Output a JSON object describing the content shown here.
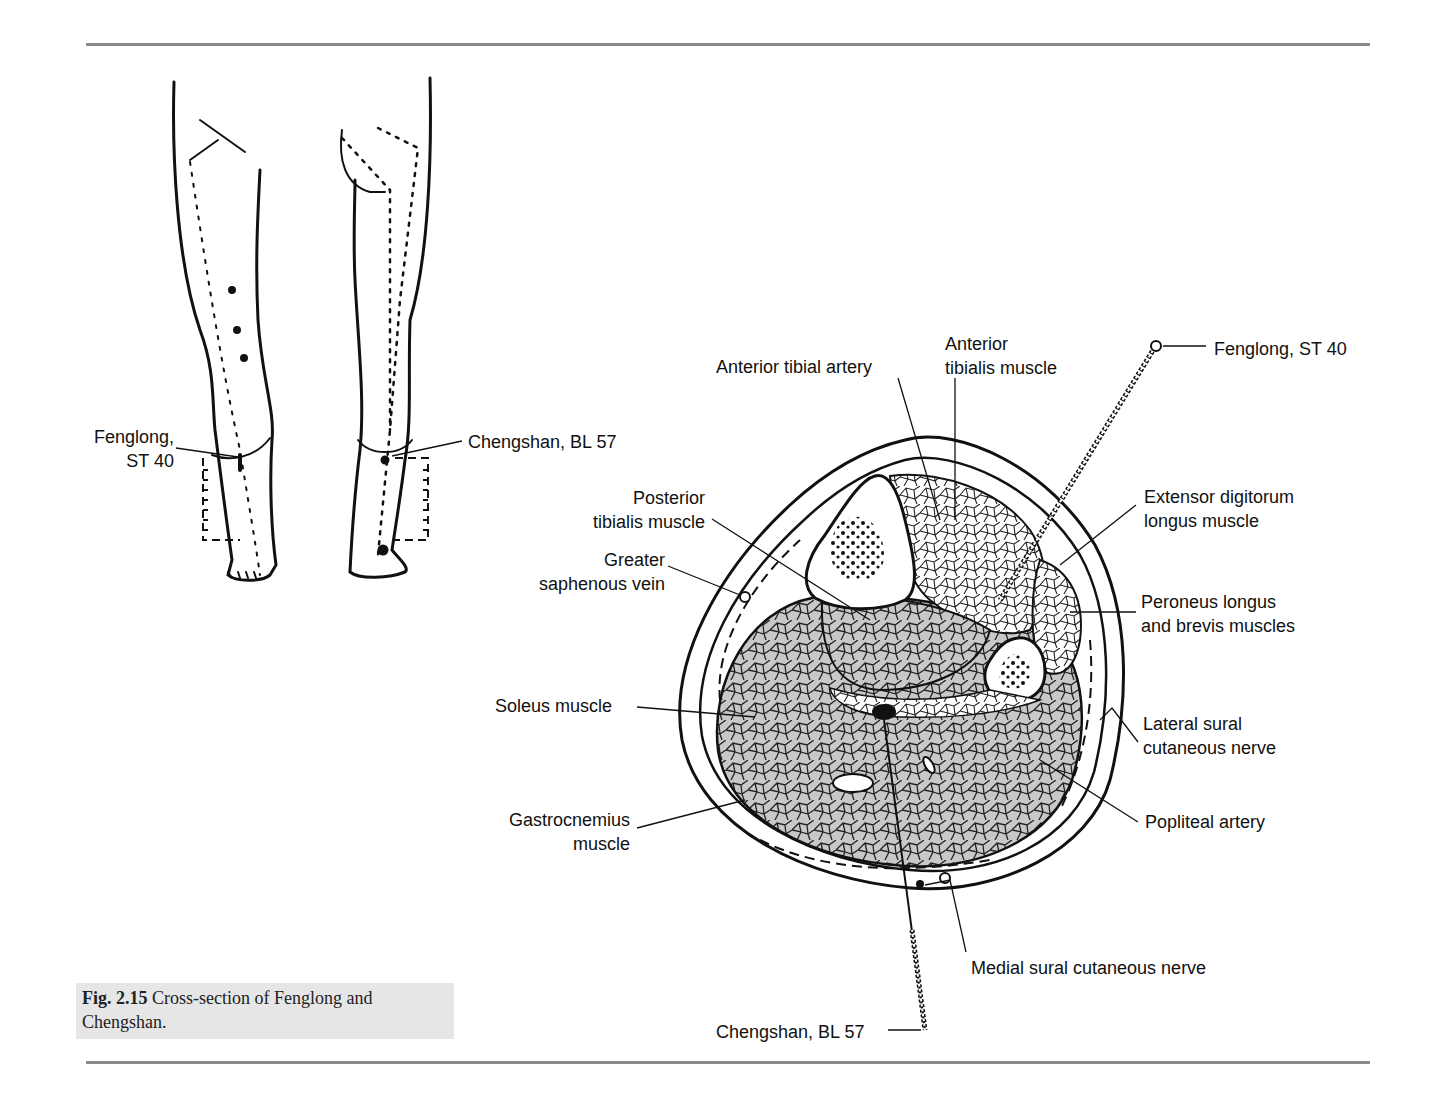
{
  "figure": {
    "number": "Fig. 2.15",
    "caption": "Cross-section of Fenglong and Chengshan."
  },
  "leg_diagram": {
    "labels": {
      "fenglong_line1": "Fenglong,",
      "fenglong_line2": "ST 40",
      "chengshan": "Chengshan, BL 57"
    }
  },
  "cross_section": {
    "labels": {
      "anterior_tibial_artery": "Anterior tibial artery",
      "anterior_tibialis_l1": "Anterior",
      "anterior_tibialis_l2": "tibialis muscle",
      "fenglong": "Fenglong, ST 40",
      "posterior_tibialis_l1": "Posterior",
      "posterior_tibialis_l2": "tibialis muscle",
      "greater_saphenous_l1": "Greater",
      "greater_saphenous_l2": "saphenous vein",
      "extensor_digitorum_l1": "Extensor digitorum",
      "extensor_digitorum_l2": "longus muscle",
      "peroneus_l1": "Peroneus longus",
      "peroneus_l2": "and brevis muscles",
      "soleus": "Soleus muscle",
      "lateral_sural_l1": "Lateral sural",
      "lateral_sural_l2": "cutaneous nerve",
      "gastrocnemius_l1": "Gastrocnemius",
      "gastrocnemius_l2": "muscle",
      "popliteal_artery": "Popliteal artery",
      "medial_sural": "Medial sural cutaneous nerve",
      "chengshan": "Chengshan, BL 57"
    }
  },
  "colors": {
    "rule": "#8a8a8a",
    "caption_bg": "#e6e6e6",
    "muscle_fill": "#c8c8c8",
    "ink": "#111111"
  }
}
